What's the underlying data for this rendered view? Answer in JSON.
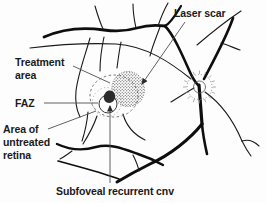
{
  "figure": {
    "type": "retina-fundus-line-diagram",
    "background_color": "#fdfdfd",
    "vessel_color": "#0e0e0e",
    "leader_color": "#4f4f4f",
    "text_color": "#1a1a1a",
    "labels": {
      "laser_scar": "Laser scar",
      "treatment_area": [
        "Treatment",
        "area"
      ],
      "faz": "FAZ",
      "untreated": [
        "Area of",
        "untreated",
        "retina"
      ],
      "subfoveal": "Subfoveal recurrent cnv"
    },
    "annotated_parts": [
      "laser-scar-stipple",
      "treatment-area-ellipse",
      "faz-circle",
      "untreated-retina-ring",
      "subfoveal-cnv-spot",
      "optic-disc"
    ]
  }
}
